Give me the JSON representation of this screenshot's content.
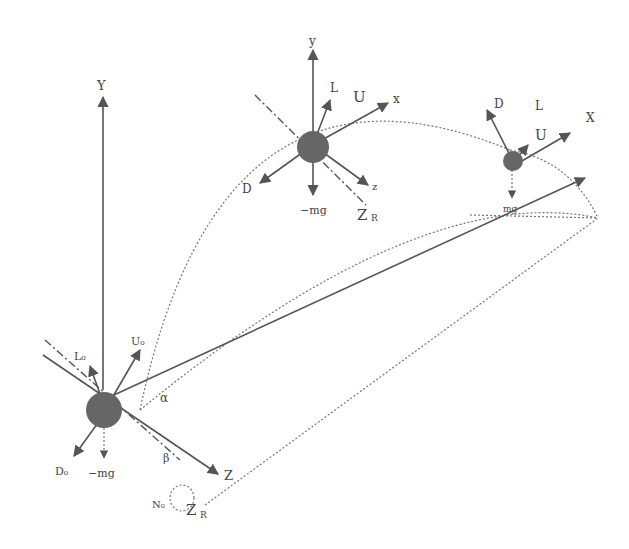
{
  "colors": {
    "ball": "#555555",
    "line": "#555555",
    "bg": "#ffffff"
  },
  "labels": {
    "origin": {
      "Y": "Y",
      "Z": "Z",
      "L0": "L₀",
      "U0": "U₀",
      "D0": "D₀",
      "mg": "−mg",
      "alpha": "α",
      "beta": "β",
      "N0": "N₀",
      "ZR": "Z",
      "ZR_sub": "R"
    },
    "mid": {
      "y": "y",
      "L": "L",
      "U": "U",
      "x": "x",
      "D": "D",
      "z": "z",
      "mg": "−mg",
      "ZR": "Z",
      "ZR_sub": "R"
    },
    "end": {
      "D": "D",
      "L": "L",
      "U": "U",
      "X": "X",
      "mg": "mg"
    }
  }
}
